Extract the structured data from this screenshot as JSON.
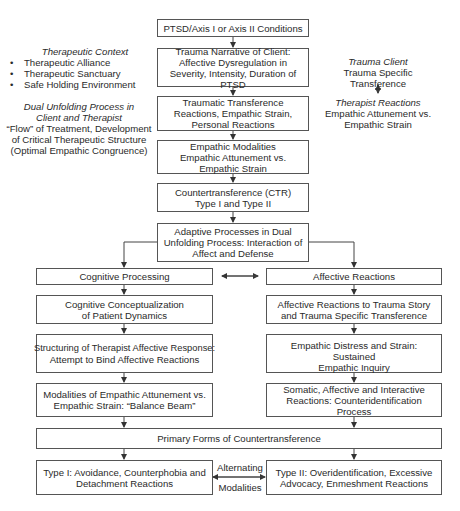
{
  "diagram": {
    "central": [
      {
        "id": "ptsd",
        "lines": [
          "PTSD/Axis I or Axis II Conditions"
        ]
      },
      {
        "id": "trauma-narrative",
        "lines": [
          "Trauma Narrative of Client:",
          "Affective Dysregulation in",
          "Severity, Intensity, Duration of PTSD"
        ]
      },
      {
        "id": "traumatic-transference",
        "lines": [
          "Traumatic Transference",
          "Reactions, Empathic Strain,",
          "Personal Reactions"
        ]
      },
      {
        "id": "empathic-modalities",
        "lines": [
          "Empathic Modalities",
          "Empathic Attunement vs.",
          "Empathic Strain"
        ]
      },
      {
        "id": "countertransference",
        "lines": [
          "Countertransference (CTR)",
          "Type I and Type II"
        ]
      },
      {
        "id": "adaptive-processes",
        "lines": [
          "Adaptive Processes in Dual",
          "Unfolding Process: Interaction of",
          "Affect and Defense"
        ]
      }
    ],
    "left_column": [
      {
        "id": "cognitive-processing",
        "lines": [
          "Cognitive Processing"
        ]
      },
      {
        "id": "cognitive-conceptualization",
        "lines": [
          "Cognitive Conceptualization",
          "of Patient Dynamics"
        ]
      },
      {
        "id": "structuring",
        "lines": [
          "Structuring of Therapist Affective Response:",
          "Attempt to Bind Affective Reactions"
        ]
      },
      {
        "id": "modalities-balance",
        "lines": [
          "Modalities of Empathic Attunement vs.",
          "Empathic Strain: “Balance Beam”"
        ]
      }
    ],
    "right_column": [
      {
        "id": "affective-reactions",
        "lines": [
          "Affective Reactions"
        ]
      },
      {
        "id": "affective-reactions-trauma",
        "lines": [
          "Affective Reactions to Trauma Story",
          "and Trauma Specific Transference"
        ]
      },
      {
        "id": "empathic-distress",
        "lines": [
          "Empathic Distress and Strain: Sustained",
          "Empathic Inquiry"
        ]
      },
      {
        "id": "somatic",
        "lines": [
          "Somatic, Affective and Interactive",
          "Reactions: Counteridentification",
          "Process"
        ]
      }
    ],
    "primary_forms": {
      "lines": [
        "Primary Forms of Countertransference"
      ]
    },
    "type1": {
      "lines": [
        "Type I: Avoidance, Counterphobia and",
        "Detachment Reactions"
      ]
    },
    "type2": {
      "lines": [
        "Type II: Overidentification, Excessive",
        "Advocacy, Enmeshment Reactions"
      ]
    },
    "alternating": {
      "line1": "Alternating",
      "line2": "Modalities"
    }
  },
  "left_notes": {
    "therapeutic_context": {
      "title": "Therapeutic Context",
      "items": [
        "Therapeutic Alliance",
        "Therapeutic Sanctuary",
        "Safe Holding Environment"
      ]
    },
    "dual_unfolding": {
      "title_line1": "Dual Unfolding Process in",
      "title_line2": "Client and Therapist",
      "body_line1": "“Flow” of Treatment, Development",
      "body_line2": "of Critical Therapeutic Structure",
      "body_line3": "(Optimal Empathic Congruence)"
    }
  },
  "right_notes": {
    "trauma_client_title": "Trauma Client",
    "trauma_client_line1": "Trauma Specific",
    "trauma_client_line2": "Transference",
    "therapist_title": "Therapist Reactions",
    "therapist_line1": "Empathic Attunement vs.",
    "therapist_line2": "Empathic Strain"
  },
  "colors": {
    "line": "#444444",
    "border": "#555555",
    "text": "#2a2a2a",
    "background": "#ffffff"
  }
}
